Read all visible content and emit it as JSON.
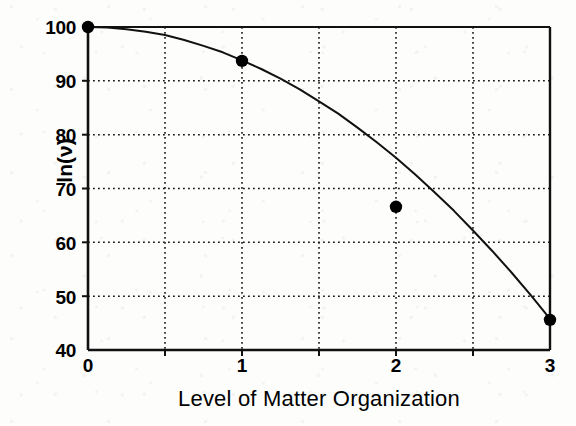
{
  "chart_data": {
    "type": "line",
    "title": "",
    "subtitle": "",
    "xlabel": "Level of Matter Organization",
    "ylabel": "ln(ν)",
    "xlim": [
      0,
      3
    ],
    "ylim": [
      40,
      100
    ],
    "xticks": [
      0,
      1,
      2,
      3
    ],
    "xtick_labels": [
      "0",
      "1",
      "2",
      "3"
    ],
    "yticks": [
      40,
      50,
      60,
      70,
      80,
      90,
      100
    ],
    "ytick_labels": [
      "40",
      "50",
      "60",
      "70",
      "80",
      "90",
      "100"
    ],
    "x_minor_gridlines": [
      0.5,
      1.0,
      1.5,
      2.0,
      2.5
    ],
    "grid": true,
    "grid_style": "dotted",
    "legend": "none",
    "series": [
      {
        "name": "fitted curve",
        "type": "line",
        "marker": "none",
        "color": "#111111",
        "x": [
          0,
          0.125,
          0.25,
          0.375,
          0.5,
          0.625,
          0.75,
          0.875,
          1.0,
          1.125,
          1.25,
          1.375,
          1.5,
          1.625,
          1.75,
          1.875,
          2.0,
          2.125,
          2.25,
          2.375,
          2.5,
          2.625,
          2.75,
          2.875,
          3.0
        ],
        "y": [
          100.0,
          99.9,
          99.6,
          99.1,
          98.5,
          97.6,
          96.5,
          95.3,
          93.8,
          92.2,
          90.4,
          88.4,
          86.2,
          83.9,
          81.3,
          78.6,
          75.7,
          72.6,
          69.3,
          65.9,
          62.2,
          58.4,
          54.4,
          50.2,
          45.8
        ]
      },
      {
        "name": "observed data points",
        "type": "scatter",
        "marker": "filled-circle",
        "color": "#000000",
        "x": [
          0,
          1,
          2,
          3
        ],
        "y": [
          100.0,
          93.7,
          66.6,
          45.6
        ]
      }
    ]
  },
  "axis": {
    "ylabel_text": "ln(ν)",
    "xlabel_text": "Level of Matter Organization"
  },
  "colors": {
    "ink": "#111111",
    "paper": "#fdfdfc",
    "grid": "#1a1a1a"
  }
}
